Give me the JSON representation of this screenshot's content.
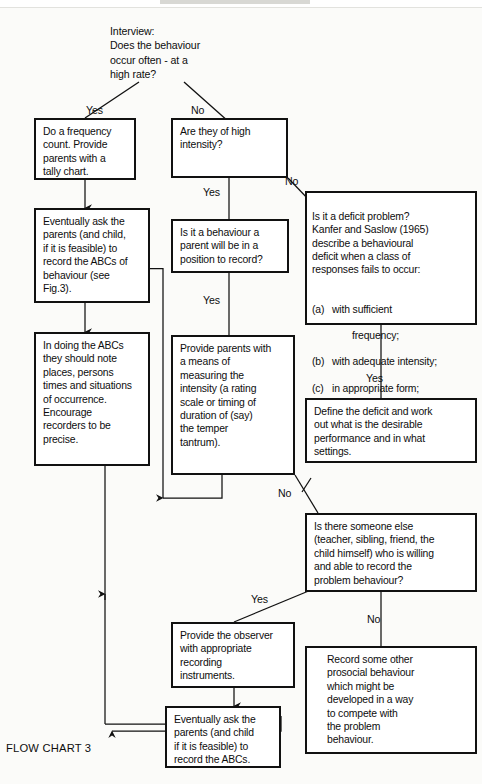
{
  "caption": "FLOW CHART 3",
  "intro": {
    "name": "interview-prompt",
    "text": "Interview:\nDoes the behaviour\noccur often - at a\nhigh rate?"
  },
  "labels": {
    "yes": "Yes",
    "no": "No"
  },
  "edge_labels": [
    {
      "id": "root-yes",
      "text": "Yes"
    },
    {
      "id": "root-no",
      "text": "No"
    },
    {
      "id": "intensity-yes",
      "text": "Yes"
    },
    {
      "id": "intensity-no",
      "text": "No"
    },
    {
      "id": "parent-record-yes",
      "text": "Yes"
    },
    {
      "id": "deficit-yes",
      "text": "Yes"
    },
    {
      "id": "intensity-measure-no",
      "text": "No"
    },
    {
      "id": "someone-else-yes",
      "text": "Yes"
    },
    {
      "id": "someone-else-no",
      "text": "No"
    }
  ],
  "boxes": {
    "frequency_count": "Do a frequency\ncount.  Provide\nparents with a\ntally chart.",
    "high_intensity": "Are they of high\nintensity?",
    "eventually_ask_abcs": "Eventually ask the\nparents (and child,\nif it is feasible) to\nrecord the ABCs of\nbehaviour (see\nFig.3).",
    "parent_position_record": "Is it a behaviour a\nparent will be in a\nposition to record?",
    "in_doing_abcs": "In doing the ABCs\nthey should note\nplaces, persons\ntimes and situations\nof occurrence.\nEncourage\nrecorders to be\nprecise.",
    "provide_means_intensity": "Provide parents with\na means of\nmeasuring the\nintensity (a rating\nscale or timing of\nduration of (say)\nthe temper\ntantrum).",
    "deficit_problem": {
      "intro": "Is it a deficit problem?\nKanfer and Saslow (1965)\ndescribe a behavioural\ndeficit when a class of\nresponses fails to occur:",
      "items": [
        {
          "marker": "(a)",
          "text": "with sufficient"
        },
        {
          "marker": "",
          "text": "frequency;",
          "continuation": true
        },
        {
          "marker": "(b)",
          "text": "with adequate intensity;"
        },
        {
          "marker": "(c)",
          "text": "in appropriate form;"
        },
        {
          "marker": "(d)",
          "text": "under socially expected"
        },
        {
          "marker": "",
          "text": "conditions.",
          "continuation": true
        }
      ]
    },
    "define_deficit": "Define the deficit and work\nout what is the desirable\nperformance and in what\nsettings.",
    "someone_else": "Is there someone else\n(teacher, sibling, friend, the\nchild himself) who is willing\nand able to record the\nproblem behaviour?",
    "provide_observer": "Provide the observer\nwith appropriate\nrecording\ninstruments.",
    "eventually_ask_short": "Eventually ask the\nparents (and child\nif it is feasible) to\nrecord the ABCs.",
    "record_prosocial": "Record some other\nprosocial behaviour\nwhich might be\ndeveloped in a way\nto  compete with\nthe problem\nbehaviour."
  },
  "colors": {
    "ink": "#0d0d0d",
    "paper": "#fbfbf9",
    "rule": "#111111"
  }
}
